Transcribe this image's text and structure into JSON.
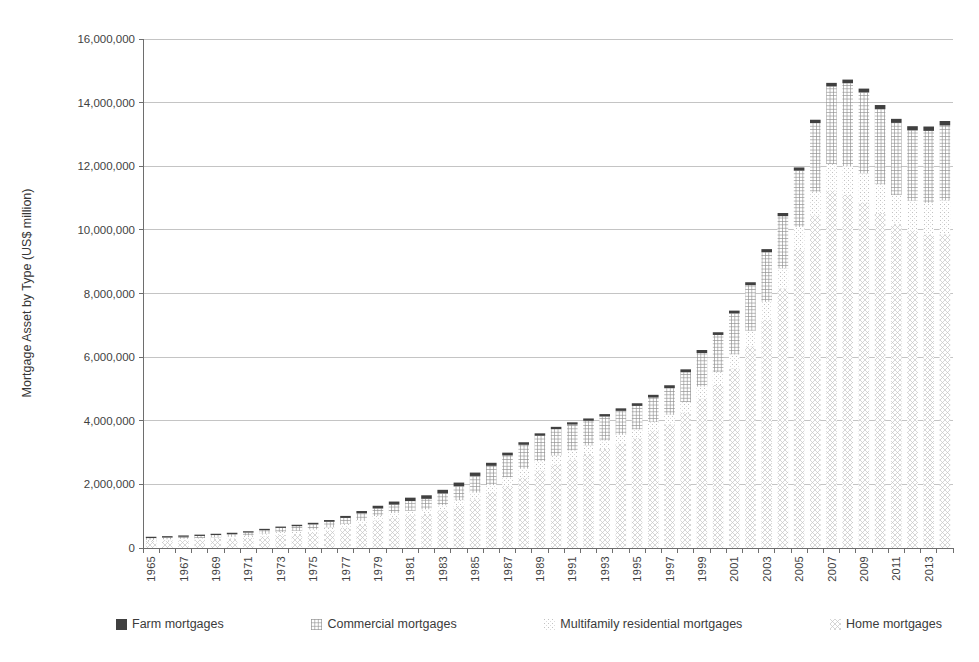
{
  "page": {
    "background": "#ffffff",
    "title": ""
  },
  "chart_data": {
    "type": "bar",
    "stacked": true,
    "title": "",
    "xlabel": "",
    "ylabel": "Mortgage Asset by Type (US$ million)",
    "ylim": [
      0,
      16000000
    ],
    "ytick_interval": 2000000,
    "ytick_labels": [
      "0",
      "2,000,000",
      "4,000,000",
      "6,000,000",
      "8,000,000",
      "10,000,000",
      "12,000,000",
      "14,000,000",
      "16,000,000"
    ],
    "xtick_step": 2,
    "xtick_labels_shown": [
      "1965",
      "1967",
      "1969",
      "1971",
      "1973",
      "1975",
      "1977",
      "1979",
      "1981",
      "1983",
      "1985",
      "1987",
      "1989",
      "1991",
      "1993",
      "1995",
      "1997",
      "1999",
      "2001",
      "2003",
      "2005",
      "2007",
      "2009",
      "2011",
      "2013"
    ],
    "grid": "horizontal",
    "legend_position": "bottom",
    "axis_color": "#6e6e6e",
    "gridline_color": "#c4c4c4",
    "text_color": "#3f3f3f",
    "years": [
      1965,
      1966,
      1967,
      1968,
      1969,
      1970,
      1971,
      1972,
      1973,
      1974,
      1975,
      1976,
      1977,
      1978,
      1979,
      1980,
      1981,
      1982,
      1983,
      1984,
      1985,
      1986,
      1987,
      1988,
      1989,
      1990,
      1991,
      1992,
      1993,
      1994,
      1995,
      1996,
      1997,
      1998,
      1999,
      2000,
      2001,
      2002,
      2003,
      2004,
      2005,
      2006,
      2007,
      2008,
      2009,
      2010,
      2011,
      2012,
      2013,
      2014
    ],
    "stack_order_bottom_to_top": [
      "Home mortgages",
      "Multifamily residential mortgages",
      "Commercial mortgages",
      "Farm mortgages"
    ],
    "series": [
      {
        "name": "Farm mortgages",
        "pattern": "solid",
        "color": "#404040",
        "values": [
          21200,
          23100,
          25100,
          27500,
          29400,
          30500,
          32400,
          35400,
          39300,
          44300,
          49900,
          55400,
          63300,
          72000,
          86800,
          97500,
          107200,
          111300,
          113700,
          112400,
          105700,
          95400,
          87700,
          80400,
          76400,
          71400,
          71100,
          72900,
          76000,
          79000,
          84000,
          86000,
          89000,
          92000,
          95000,
          85000,
          88000,
          91000,
          96000,
          99000,
          101000,
          104000,
          113000,
          115000,
          120000,
          124000,
          127000,
          132000,
          137000,
          140000
        ]
      },
      {
        "name": "Commercial mortgages",
        "pattern": "grid",
        "color": "#8f8f8f",
        "values": [
          54500,
          58100,
          62300,
          66900,
          71400,
          85800,
          95900,
          112700,
          131100,
          146000,
          158900,
          170800,
          188700,
          211700,
          235700,
          262600,
          302300,
          330000,
          369000,
          438000,
          522000,
          604000,
          686000,
          750000,
          800000,
          829000,
          813000,
          772000,
          748000,
          755000,
          740000,
          768000,
          840000,
          935000,
          1055000,
          1168000,
          1283000,
          1433000,
          1559000,
          1643000,
          1770000,
          2159000,
          2437000,
          2605000,
          2545000,
          2364000,
          2267000,
          2213000,
          2262000,
          2355000
        ]
      },
      {
        "name": "Multifamily residential mortgages",
        "pattern": "dots",
        "color": "#c9c9c9",
        "values": [
          37200,
          40300,
          43900,
          47300,
          52200,
          60100,
          70000,
          82000,
          93000,
          100000,
          100600,
          105700,
          114000,
          125000,
          134900,
          142100,
          142000,
          146000,
          160000,
          186000,
          214000,
          247000,
          265000,
          278000,
          287000,
          288000,
          284000,
          272000,
          269000,
          269000,
          274000,
          287000,
          296000,
          331000,
          374000,
          404000,
          447000,
          487000,
          563000,
          627000,
          705000,
          743000,
          833000,
          903000,
          914000,
          902000,
          913000,
          952000,
          998000,
          1065000
        ]
      },
      {
        "name": "Home mortgages",
        "pattern": "diagonal-crosshatch",
        "color": "#c4c4c4",
        "values": [
          220500,
          232900,
          247300,
          264800,
          283200,
          292400,
          319000,
          366500,
          407900,
          440200,
          482800,
          546900,
          642400,
          753300,
          870500,
          957900,
          1031000,
          1070000,
          1186000,
          1320000,
          1529000,
          1732000,
          1959000,
          2216000,
          2441000,
          2620000,
          2783000,
          2955000,
          3116000,
          3287000,
          3452000,
          3674000,
          3891000,
          4258000,
          4700000,
          5125000,
          5644000,
          6343000,
          7177000,
          8161000,
          9386000,
          10456000,
          11238000,
          11101000,
          10862000,
          10534000,
          10183000,
          9962000,
          9852000,
          9862000
        ]
      }
    ]
  }
}
